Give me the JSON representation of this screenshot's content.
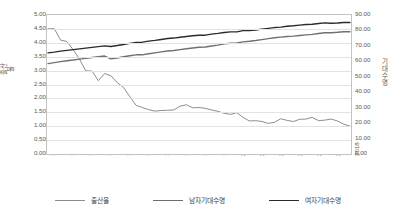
{
  "chart_data": {
    "type": "line",
    "title": "",
    "xlabel": "",
    "ylabel": "출산율",
    "y2label": "기대수명",
    "grid": true,
    "legend_position": "bottom",
    "ylim": [
      0,
      5
    ],
    "y2lim": [
      0,
      90
    ],
    "xlim": [
      1970,
      2018
    ],
    "yticks": [
      "0.00",
      "0.50",
      "1.00",
      "1.50",
      "2.00",
      "2.50",
      "3.00",
      "3.50",
      "4.00",
      "4.50",
      "5.00"
    ],
    "y2ticks": [
      "0.00",
      "10.00",
      "20.00",
      "30.00",
      "40.00",
      "50.00",
      "60.00",
      "70.00",
      "80.00",
      "90.00"
    ],
    "xticks": [
      "1970",
      "1973",
      "1976",
      "1979",
      "1982",
      "1985",
      "1988",
      "1991",
      "1994",
      "1997",
      "2000",
      "2003",
      "2006",
      "2009",
      "2012",
      "2015",
      "2018"
    ],
    "x": [
      1970,
      1971,
      1972,
      1973,
      1974,
      1975,
      1976,
      1977,
      1978,
      1979,
      1980,
      1981,
      1982,
      1983,
      1984,
      1985,
      1986,
      1987,
      1988,
      1989,
      1990,
      1991,
      1992,
      1993,
      1994,
      1995,
      1996,
      1997,
      1998,
      1999,
      2000,
      2001,
      2002,
      2003,
      2004,
      2005,
      2006,
      2007,
      2008,
      2009,
      2010,
      2011,
      2012,
      2013,
      2014,
      2015,
      2016,
      2017,
      2018
    ],
    "series": [
      {
        "name": "출산율",
        "axis": "left",
        "color": "#808080",
        "values": [
          4.53,
          4.54,
          4.12,
          4.07,
          3.77,
          3.43,
          3.0,
          2.99,
          2.64,
          2.9,
          2.82,
          2.57,
          2.39,
          2.06,
          1.74,
          1.66,
          1.58,
          1.53,
          1.55,
          1.56,
          1.57,
          1.71,
          1.76,
          1.65,
          1.66,
          1.63,
          1.57,
          1.52,
          1.45,
          1.41,
          1.47,
          1.3,
          1.17,
          1.18,
          1.15,
          1.08,
          1.12,
          1.25,
          1.19,
          1.15,
          1.23,
          1.24,
          1.3,
          1.18,
          1.2,
          1.24,
          1.17,
          1.05,
          0.98
        ]
      },
      {
        "name": "남자기대수명",
        "axis": "right",
        "color": "#707070",
        "values": [
          58.7,
          59.4,
          60.0,
          60.6,
          61.1,
          61.7,
          62.2,
          62.7,
          63.2,
          63.7,
          61.8,
          62.4,
          63.2,
          63.9,
          64.5,
          64.5,
          65.2,
          65.8,
          66.4,
          67.0,
          67.3,
          67.9,
          68.5,
          69.0,
          69.5,
          69.6,
          70.3,
          70.9,
          71.7,
          72.1,
          72.3,
          73.0,
          73.4,
          73.9,
          74.5,
          75.1,
          75.7,
          76.1,
          76.5,
          76.8,
          77.2,
          77.6,
          77.9,
          78.5,
          79.0,
          79.0,
          79.3,
          79.7,
          79.7
        ]
      },
      {
        "name": "여자기대수명",
        "axis": "right",
        "color": "#2b2b2b",
        "values": [
          65.8,
          66.3,
          66.9,
          67.4,
          67.9,
          68.4,
          68.9,
          69.4,
          69.9,
          70.4,
          70.0,
          70.6,
          71.3,
          72.0,
          72.7,
          72.8,
          73.5,
          74.0,
          74.6,
          75.2,
          75.5,
          76.0,
          76.5,
          77.0,
          77.4,
          77.4,
          78.1,
          78.6,
          79.2,
          79.6,
          79.6,
          80.4,
          80.4,
          80.8,
          81.4,
          81.9,
          82.4,
          82.7,
          83.3,
          83.6,
          84.0,
          84.4,
          84.6,
          85.1,
          85.5,
          85.2,
          85.4,
          85.7,
          85.7
        ]
      }
    ]
  },
  "legend": {
    "items": [
      {
        "label": "출산율",
        "color": "#8c8c8c"
      },
      {
        "label": "남자기대수명",
        "color": "#6e6e6e"
      },
      {
        "label": "여자기대수명",
        "color": "#2b2b2b"
      }
    ]
  }
}
